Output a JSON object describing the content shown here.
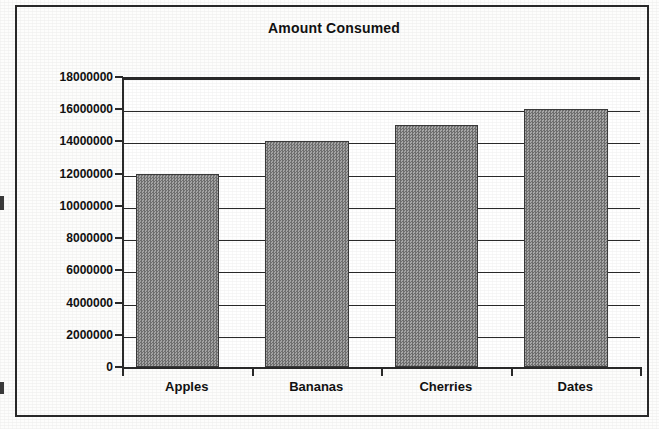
{
  "chart_data": {
    "type": "bar",
    "title": "Amount Consumed",
    "xlabel": "",
    "ylabel": "",
    "categories": [
      "Apples",
      "Bananas",
      "Cherries",
      "Dates"
    ],
    "values": [
      12000000,
      14000000,
      15000000,
      16000000
    ],
    "series": [
      {
        "name": "Amount Consumed",
        "values": [
          12000000,
          14000000,
          15000000,
          16000000
        ]
      }
    ],
    "ylim": [
      0,
      18000000
    ],
    "ytick_step": 2000000,
    "ytick_labels": [
      "0",
      "2000000",
      "4000000",
      "6000000",
      "8000000",
      "10000000",
      "12000000",
      "14000000",
      "16000000",
      "18000000"
    ],
    "ytick_values": [
      0,
      2000000,
      4000000,
      6000000,
      8000000,
      10000000,
      12000000,
      14000000,
      16000000,
      18000000
    ],
    "grid": true,
    "grid_axis": "y",
    "legend": false,
    "legend_position": "none",
    "bar_fill_color": "#8a8a8a",
    "bar_border_color": "#3a3a3a",
    "axis_color": "#2a2a2a",
    "plot_background": "#ffffff",
    "page_background": "#fdfdfc"
  }
}
